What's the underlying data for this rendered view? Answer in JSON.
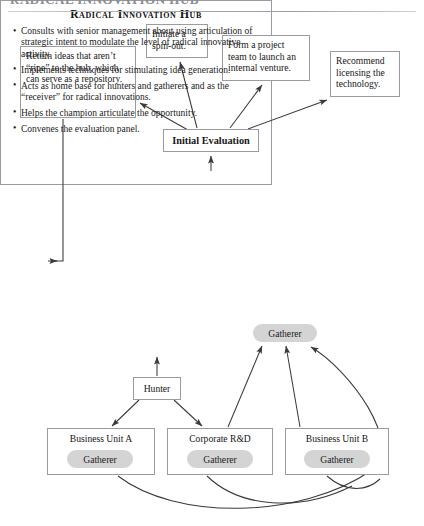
{
  "page": {
    "running_header": "RADICAL INNOVATION HUB"
  },
  "diagram": {
    "type": "flowchart",
    "outcomes": [
      {
        "id": "spin-out",
        "label": "Initiate a spin-out."
      },
      {
        "id": "project-team",
        "label": "Form a project team to launch an internal venture."
      },
      {
        "id": "license",
        "label": "Recommend licensing the technology."
      },
      {
        "id": "return-ideas",
        "label": "Return ideas that aren’t “ripe” to the hub, which can serve as a repository."
      }
    ],
    "evaluation": {
      "label": "Initial Evaluation"
    },
    "hub": {
      "title": "Radical Innovation Hub",
      "bullets": [
        "Consults with senior management about using articulation of strategic intent to modulate the level of radical innovative activity.",
        "Implements techniques for stimulating idea generation.",
        "Acts as home base for hunters and gatherers and as the “receiver” for radical innovations.",
        "Helps the champion articulate the opportunity.",
        "Convenes the evaluation panel."
      ],
      "gatherer_label": "Gatherer"
    },
    "hunter": {
      "label": "Hunter"
    },
    "units": [
      {
        "id": "business-unit-a",
        "label": "Business Unit A",
        "gatherer_label": "Gatherer"
      },
      {
        "id": "corporate-rd",
        "label": "Corporate R&D",
        "gatherer_label": "Gatherer"
      },
      {
        "id": "business-unit-b",
        "label": "Business Unit B",
        "gatherer_label": "Gatherer"
      }
    ],
    "colors": {
      "line": "#3a3a3a",
      "box_border": "#9a9aa0",
      "pill_fill": "#d4d4d4",
      "background": "#ffffff"
    }
  }
}
